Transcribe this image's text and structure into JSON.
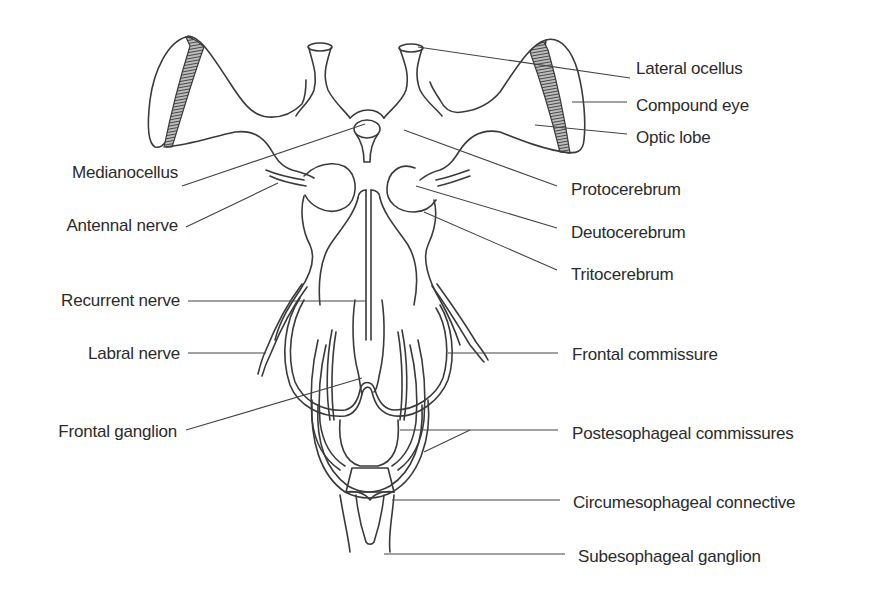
{
  "figure": {
    "labels_left": [
      {
        "id": "medianocellus",
        "text": "Medianocellus"
      },
      {
        "id": "antennal-nerve",
        "text": "Antennal nerve"
      },
      {
        "id": "recurrent-nerve",
        "text": "Recurrent nerve"
      },
      {
        "id": "labral-nerve",
        "text": "Labral nerve"
      },
      {
        "id": "frontal-ganglion",
        "text": "Frontal ganglion"
      }
    ],
    "labels_right": [
      {
        "id": "lateral-ocellus",
        "text": "Lateral ocellus"
      },
      {
        "id": "compound-eye",
        "text": "Compound eye"
      },
      {
        "id": "optic-lobe",
        "text": "Optic lobe"
      },
      {
        "id": "protocerebrum",
        "text": "Protocerebrum"
      },
      {
        "id": "deutocerebrum",
        "text": "Deutocerebrum"
      },
      {
        "id": "tritocerebrum",
        "text": "Tritocerebrum"
      },
      {
        "id": "frontal-commissure",
        "text": "Frontal commissure"
      },
      {
        "id": "postesophageal-commissures",
        "text": "Postesophageal commissures"
      },
      {
        "id": "circumesophageal-connective",
        "text": "Circumesophageal connective"
      },
      {
        "id": "subesophageal-ganglion",
        "text": "Subesophageal ganglion"
      }
    ]
  }
}
